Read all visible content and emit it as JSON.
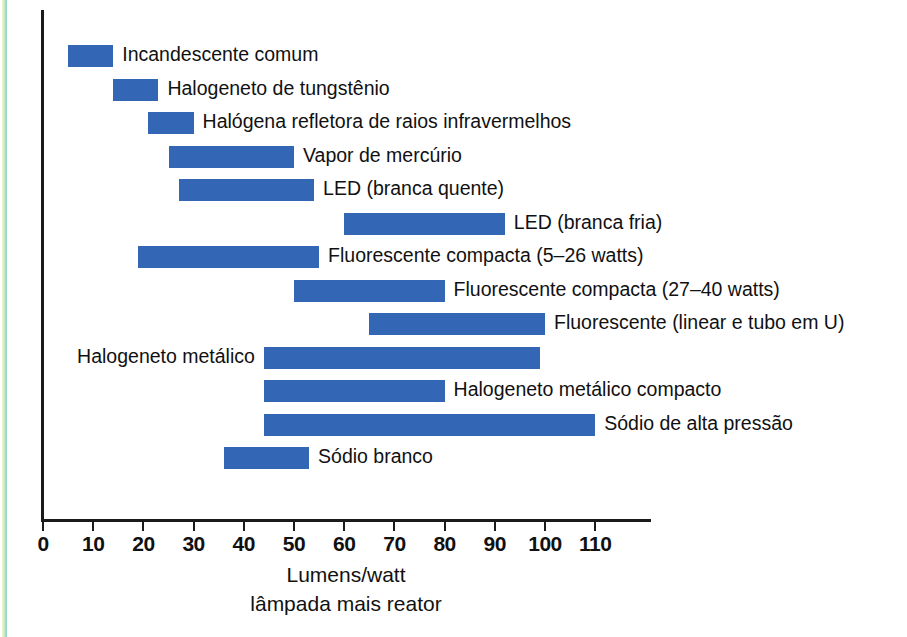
{
  "chart_data": {
    "type": "bar",
    "orientation": "horizontal-range",
    "title": "",
    "xlabel_lines": [
      "Lumens/watt",
      "lâmpada mais reator"
    ],
    "ylabel": "",
    "xlim": [
      0,
      118
    ],
    "xticks": [
      0,
      10,
      20,
      30,
      40,
      50,
      60,
      70,
      80,
      90,
      100,
      110
    ],
    "xtick_labels": [
      "0",
      "10",
      "20",
      "30",
      "40",
      "50",
      "60",
      "70",
      "80",
      "90",
      "100",
      "110"
    ],
    "grid": false,
    "legend": "none",
    "bar_color": "#3367b5",
    "axis_color": "#1b1b1b",
    "categories": [
      "Incandescente comum",
      "Halogeneto de tungstênio",
      "Halógena refletora de raios infravermelhos",
      "Vapor de mercúrio",
      "LED (branca quente)",
      "LED (branca fria)",
      "Fluorescente compacta (5–26 watts)",
      "Fluorescente compacta (27–40 watts)",
      "Fluorescente (linear e tubo em U)",
      "Halogeneto metálico",
      "Halogeneto metálico compacto",
      "Sódio de alta pressão",
      "Sódio branco"
    ],
    "ranges": [
      {
        "label": "Incandescente comum",
        "start": 5,
        "end": 14,
        "label_side": "right"
      },
      {
        "label": "Halogeneto de tungstênio",
        "start": 14,
        "end": 23,
        "label_side": "right"
      },
      {
        "label": "Halógena refletora de raios infravermelhos",
        "start": 21,
        "end": 30,
        "label_side": "right"
      },
      {
        "label": "Vapor de mercúrio",
        "start": 25,
        "end": 50,
        "label_side": "right"
      },
      {
        "label": "LED (branca quente)",
        "start": 27,
        "end": 54,
        "label_side": "right"
      },
      {
        "label": "LED (branca fria)",
        "start": 60,
        "end": 92,
        "label_side": "right"
      },
      {
        "label": "Fluorescente compacta (5–26 watts)",
        "start": 19,
        "end": 55,
        "label_side": "right"
      },
      {
        "label": "Fluorescente compacta (27–40 watts)",
        "start": 50,
        "end": 80,
        "label_side": "right"
      },
      {
        "label": "Fluorescente (linear e tubo em U)",
        "start": 65,
        "end": 100,
        "label_side": "right"
      },
      {
        "label": "Halogeneto metálico",
        "start": 44,
        "end": 99,
        "label_side": "left"
      },
      {
        "label": "Halogeneto metálico compacto",
        "start": 44,
        "end": 80,
        "label_side": "right"
      },
      {
        "label": "Sódio de alta pressão",
        "start": 44,
        "end": 110,
        "label_side": "right"
      },
      {
        "label": "Sódio branco",
        "start": 36,
        "end": 53,
        "label_side": "right"
      }
    ]
  },
  "axis": {
    "title_line1": "Lumens/watt",
    "title_line2": "lâmpada mais reator"
  }
}
